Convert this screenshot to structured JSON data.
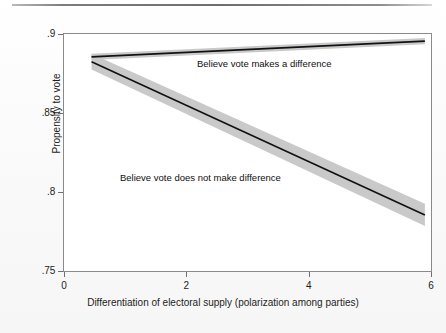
{
  "chart_data": {
    "type": "line",
    "title": "",
    "subtitle": "",
    "xlabel": "Differentiation of electoral supply (polarization among parties)",
    "ylabel": "Propensity to vote",
    "xlim": [
      0,
      6
    ],
    "ylim": [
      0.75,
      0.9
    ],
    "xticks": [
      "0",
      "2",
      "4",
      "6"
    ],
    "xtick_values": [
      0,
      2,
      4,
      6
    ],
    "yticks": [
      ".75",
      ".8",
      ".85",
      ".9"
    ],
    "ytick_values": [
      0.75,
      0.8,
      0.85,
      0.9
    ],
    "grid": false,
    "legend_position": "inline-annotations",
    "band_color": "#c9c9c9",
    "line_color": "#111111",
    "series": [
      {
        "name": "Believe vote makes a difference",
        "x": [
          0.45,
          5.9
        ],
        "values": [
          0.8855,
          0.8955
        ],
        "ci_low": [
          0.8835,
          0.8935
        ],
        "ci_high": [
          0.8875,
          0.8975
        ],
        "annotation": "Believe vote makes a difference"
      },
      {
        "name": "Believe vote does not make difference",
        "x": [
          0.45,
          5.9
        ],
        "values": [
          0.8825,
          0.7855
        ],
        "ci_low": [
          0.8775,
          0.7785
        ],
        "ci_high": [
          0.8875,
          0.7925
        ],
        "annotation": "Believe vote does not make difference"
      }
    ]
  },
  "figure": {
    "axis_color": "#8a8a8a",
    "background": "#ffffff",
    "top_rule": "horizontal-rule"
  }
}
